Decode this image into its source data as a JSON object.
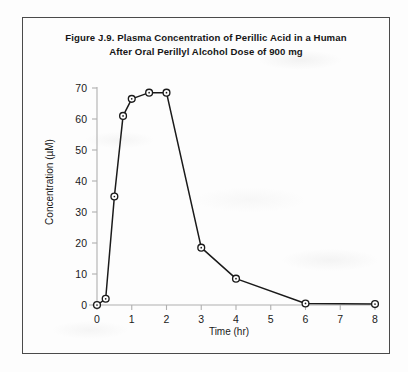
{
  "figure": {
    "title_line1": "Figure J.9.  Plasma Concentration of Perillic Acid in a Human",
    "title_line2": "After Oral Perillyl Alcohol Dose of 900 mg",
    "border_color": "#4a4a4a",
    "background_color": "#fdfdfd"
  },
  "chart_data": {
    "type": "line",
    "title": "Figure J.9.  Plasma Concentration of Perillic Acid in a Human After Oral Perillyl Alcohol Dose of 900 mg",
    "xlabel": "Time (hr)",
    "ylabel": "Concentration (µM)",
    "xlim": [
      0,
      8
    ],
    "ylim": [
      0,
      70
    ],
    "xticks": [
      0,
      1,
      2,
      3,
      4,
      5,
      6,
      7,
      8
    ],
    "xticklabels": [
      "0",
      "1",
      "2",
      "3",
      "4",
      "5",
      "6",
      "7",
      "8"
    ],
    "yticks": [
      0,
      10,
      20,
      30,
      40,
      50,
      60,
      70
    ],
    "yticklabels": [
      "0",
      "10",
      "20",
      "30",
      "40",
      "50",
      "60",
      "70"
    ],
    "grid": false,
    "legend": null,
    "marker": "open-circle-with-dot",
    "line_color": "#1a1a1a",
    "marker_color": "#1a1a1a",
    "axis_color": "#b0b0b0",
    "x": [
      0,
      0.25,
      0.5,
      0.75,
      1.0,
      1.5,
      2.0,
      3.0,
      4.0,
      6.0,
      8.0
    ],
    "values": [
      0,
      2,
      35,
      61,
      66.5,
      68.5,
      68.5,
      18.5,
      8.5,
      0.5,
      0.3
    ],
    "series": [
      {
        "name": "Perillic acid plasma concentration",
        "x": [
          0,
          0.25,
          0.5,
          0.75,
          1.0,
          1.5,
          2.0,
          3.0,
          4.0,
          6.0,
          8.0
        ],
        "values": [
          0,
          2,
          35,
          61,
          66.5,
          68.5,
          68.5,
          18.5,
          8.5,
          0.5,
          0.3
        ]
      }
    ]
  }
}
